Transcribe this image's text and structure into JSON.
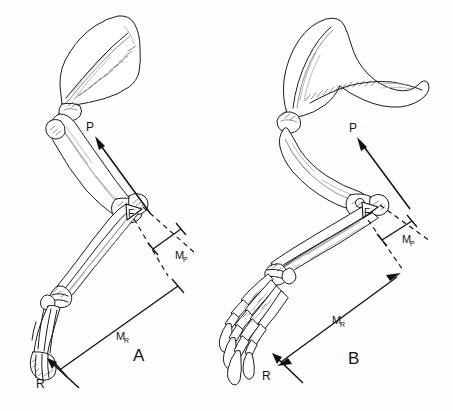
{
  "figure": {
    "background_color": "#fdfdfd",
    "ink_color": "#1c1c1c",
    "width": 453,
    "height": 411
  },
  "panels": [
    {
      "id": "A",
      "label": "A",
      "label_x": 139,
      "label_y": 355,
      "limb_type": "ungulate-forelimb",
      "manus_type": "hoofed",
      "scapula_shape": "fan-shaped",
      "vectors": [
        {
          "name": "P",
          "label": "P",
          "label_x": 92,
          "label_y": 127,
          "meaning": "muscle-pull-force",
          "arrowhead": "solid"
        },
        {
          "name": "F",
          "label": "F",
          "label_x": 131,
          "label_y": 216,
          "meaning": "fulcrum-force-at-elbow",
          "arrowhead": "hollow"
        },
        {
          "name": "R",
          "label": "R",
          "label_x": 40,
          "label_y": 384,
          "meaning": "ground-reaction-force",
          "arrowhead": "solid"
        }
      ],
      "moment_arms": [
        {
          "name": "MP",
          "label": "M",
          "subscript": "P",
          "label_x": 183,
          "label_y": 257,
          "meaning": "in-lever-moment-arm-of-P"
        },
        {
          "name": "MR",
          "label": "M",
          "subscript": "R",
          "label_x": 124,
          "label_y": 337,
          "meaning": "out-lever-moment-arm-of-R"
        }
      ]
    },
    {
      "id": "B",
      "label": "B",
      "label_x": 354,
      "label_y": 358,
      "limb_type": "clawed-carnivore-forelimb",
      "manus_type": "clawed",
      "scapula_shape": "hook-shaped-with-prominent-spine",
      "vectors": [
        {
          "name": "P",
          "label": "P",
          "label_x": 354,
          "label_y": 128,
          "meaning": "muscle-pull-force",
          "arrowhead": "solid"
        },
        {
          "name": "F",
          "label": "F",
          "label_x": 367,
          "label_y": 216,
          "meaning": "fulcrum-force-at-elbow",
          "arrowhead": "hollow"
        },
        {
          "name": "R",
          "label": "R",
          "label_x": 266,
          "label_y": 376,
          "meaning": "ground-reaction-force",
          "arrowhead": "solid"
        }
      ],
      "moment_arms": [
        {
          "name": "MP",
          "label": "M",
          "subscript": "P",
          "label_x": 409,
          "label_y": 240,
          "meaning": "in-lever-moment-arm-of-P"
        },
        {
          "name": "MR",
          "label": "M",
          "subscript": "R",
          "label_x": 340,
          "label_y": 321,
          "meaning": "out-lever-moment-arm-of-R"
        }
      ]
    }
  ]
}
